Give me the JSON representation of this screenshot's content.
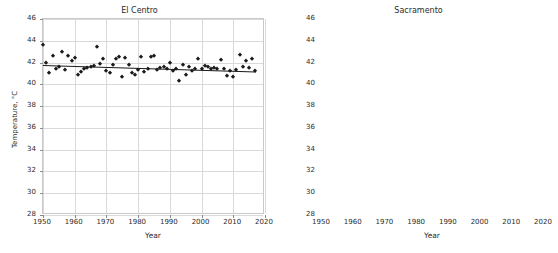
{
  "figure": {
    "width": 558,
    "height": 253,
    "background": "#ffffff",
    "marker_color": "#1a1a1a",
    "trend_color": "#1a1a1a",
    "grid_color": "#d9d9d9"
  },
  "chart_data": [
    {
      "type": "scatter",
      "title": "El Centro",
      "xlabel": "Year",
      "ylabel": "Temperature, °C",
      "xlim": [
        1950,
        2020
      ],
      "ylim": [
        28,
        46
      ],
      "xticks": [
        1950,
        1960,
        1970,
        1980,
        1990,
        2000,
        2010,
        2020
      ],
      "yticks": [
        28,
        30,
        32,
        34,
        36,
        38,
        40,
        42,
        44,
        46
      ],
      "grid": true,
      "legend": "none",
      "marker": "diamond",
      "trendline": {
        "x": [
          1950,
          2017
        ],
        "y": [
          41.75,
          41.15
        ]
      },
      "x": [
        1950,
        1951,
        1952,
        1953,
        1954,
        1955,
        1956,
        1957,
        1958,
        1959,
        1960,
        1961,
        1962,
        1963,
        1964,
        1965,
        1966,
        1967,
        1968,
        1969,
        1970,
        1971,
        1972,
        1973,
        1974,
        1975,
        1976,
        1977,
        1978,
        1979,
        1980,
        1981,
        1982,
        1983,
        1984,
        1985,
        1986,
        1987,
        1988,
        1989,
        1990,
        1991,
        1992,
        1993,
        1994,
        1995,
        1996,
        1997,
        1998,
        1999,
        2000,
        2001,
        2002,
        2003,
        2004,
        2005,
        2006,
        2007,
        2008,
        2009,
        2010,
        2011,
        2012,
        2013,
        2014,
        2015,
        2016,
        2017
      ],
      "y": [
        43.6,
        42.0,
        41.0,
        42.6,
        41.4,
        41.6,
        43.0,
        41.3,
        42.6,
        42.1,
        42.4,
        40.9,
        41.1,
        41.4,
        41.5,
        41.6,
        41.7,
        43.4,
        41.9,
        42.3,
        41.2,
        41.0,
        41.8,
        42.3,
        42.5,
        40.7,
        42.4,
        41.8,
        41.0,
        40.9,
        41.3,
        42.5,
        41.1,
        41.4,
        42.5,
        42.6,
        41.3,
        41.5,
        41.6,
        41.4,
        42.0,
        41.2,
        41.4,
        40.3,
        41.8,
        40.9,
        41.6,
        41.2,
        41.4,
        42.3,
        41.4,
        41.7,
        41.6,
        41.4,
        41.5,
        41.4,
        42.2,
        41.4,
        40.8,
        41.2,
        40.7,
        41.3,
        42.7,
        41.6,
        42.1,
        41.5,
        42.3,
        41.2
      ]
    },
    {
      "type": "scatter",
      "title": "Sacramento",
      "xlabel": "Year",
      "ylabel": "",
      "xlim": [
        1950,
        2020
      ],
      "ylim": [
        28,
        46
      ],
      "xticks": [
        1950,
        1960,
        1970,
        1980,
        1990,
        2000,
        2010,
        2020
      ],
      "yticks": [
        28,
        30,
        32,
        34,
        36,
        38,
        40,
        42,
        44,
        46
      ],
      "grid": true,
      "legend": "none",
      "marker": "triangle",
      "trendline": {
        "x": [
          1950,
          2017
        ],
        "y": [
          32.9,
          34.4
        ]
      },
      "x": [
        1950,
        1951,
        1952,
        1953,
        1954,
        1955,
        1956,
        1957,
        1958,
        1959,
        1960,
        1961,
        1962,
        1963,
        1964,
        1965,
        1966,
        1967,
        1968,
        1969,
        1970,
        1971,
        1972,
        1973,
        1974,
        1975,
        1976,
        1977,
        1978,
        1979,
        1980,
        1981,
        1982,
        1983,
        1984,
        1985,
        1986,
        1987,
        1988,
        1989,
        1990,
        1991,
        1992,
        1993,
        1994,
        1995,
        1996,
        1997,
        1998,
        1999,
        2000,
        2001,
        2002,
        2003,
        2004,
        2005,
        2006,
        2007,
        2008,
        2009,
        2010,
        2011,
        2012,
        2013,
        2014,
        2015,
        2016,
        2017
      ],
      "y": [
        31.9,
        29.2,
        30.6,
        32.4,
        31.9,
        31.2,
        33.6,
        31.4,
        34.2,
        34.4,
        34.0,
        33.5,
        31.7,
        33.5,
        33.8,
        32.2,
        35.8,
        35.7,
        33.0,
        34.1,
        33.0,
        31.6,
        33.2,
        33.3,
        33.0,
        31.2,
        34.5,
        32.9,
        33.0,
        32.6,
        33.2,
        34.3,
        31.7,
        32.0,
        34.9,
        33.7,
        34.0,
        34.4,
        35.0,
        34.1,
        34.9,
        33.9,
        33.0,
        32.7,
        34.8,
        33.5,
        34.9,
        35.6,
        33.3,
        34.1,
        33.6,
        34.6,
        34.3,
        34.1,
        34.2,
        34.0,
        35.4,
        34.3,
        33.6,
        33.6,
        33.1,
        33.3,
        35.5,
        34.5,
        35.2,
        34.3,
        35.4,
        34.4
      ]
    }
  ]
}
